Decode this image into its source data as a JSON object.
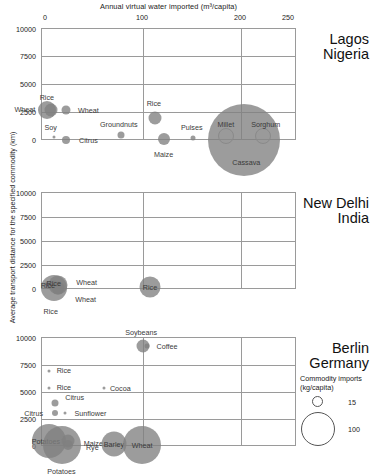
{
  "axes": {
    "x_title": "Annual virtual water imported (m³/capita)",
    "y_title": "Average transport distance for the specified commodity (km)",
    "x_ticks": [
      "0",
      "100",
      "200",
      "250"
    ],
    "y_ticks": [
      "10000",
      "7500",
      "5000",
      "2500",
      "0"
    ]
  },
  "legend": {
    "title_line1": "Commodity imports",
    "title_line2": "(kg/capita)",
    "small_value": "15",
    "large_value": "100"
  },
  "panels": [
    {
      "city": "Lagos",
      "country": "Nigeria"
    },
    {
      "city": "New Delhi",
      "country": "India"
    },
    {
      "city": "Berlin",
      "country": "Germany"
    }
  ],
  "chart_data": {
    "type": "scatter",
    "title": "",
    "xlabel": "Annual virtual water imported (m³/capita)",
    "ylabel": "Average transport distance for the specified commodity (km)",
    "xlim": [
      0,
      260
    ],
    "ylim": [
      -1500,
      10000
    ],
    "grid": true,
    "size_encoding": "Commodity imports (kg/capita)",
    "size_legend": [
      15,
      100
    ],
    "legend_position": "bottom-right",
    "series": [
      {
        "name": "Lagos, Nigeria",
        "points": [
          {
            "label": "Wheat",
            "x": 2,
            "y": 2700,
            "size": 18,
            "label_dx": -22,
            "label_dy": -1
          },
          {
            "label": "Rice",
            "x": 6,
            "y": 2700,
            "size": 13,
            "label_dx": -4,
            "label_dy": -13
          },
          {
            "label": "Wheat",
            "x": 22,
            "y": 2650,
            "size": 9,
            "label_dx": 22,
            "label_dy": 0
          },
          {
            "label": "Soy",
            "x": 9,
            "y": 300,
            "size": 3,
            "label_dx": -3,
            "label_dy": -10
          },
          {
            "label": "Citrus",
            "x": 22,
            "y": 0,
            "size": 8,
            "label_dx": 22,
            "label_dy": 0
          },
          {
            "label": "Groundnuts",
            "x": 78,
            "y": 450,
            "size": 7,
            "label_dx": -2,
            "label_dy": -11
          },
          {
            "label": "Rice",
            "x": 113,
            "y": 2000,
            "size": 13,
            "label_dx": -1,
            "label_dy": -15
          },
          {
            "label": "Maize",
            "x": 122,
            "y": 100,
            "size": 12,
            "label_dx": 0,
            "label_dy": 15
          },
          {
            "label": "Pulses",
            "x": 152,
            "y": 150,
            "size": 5,
            "label_dx": -1,
            "label_dy": -11
          },
          {
            "label": "Cassava",
            "x": 205,
            "y": 0,
            "size": 72,
            "label_dx": 2,
            "label_dy": 22
          },
          {
            "label": "Millet",
            "x": 186,
            "y": 400,
            "size": 14,
            "label_dx": 0,
            "label_dy": -12,
            "ring": true
          },
          {
            "label": "Sorghum",
            "x": 224,
            "y": 400,
            "size": 14,
            "label_dx": 3,
            "label_dy": -12,
            "ring": true
          }
        ]
      },
      {
        "name": "New Delhi, India",
        "points": [
          {
            "label": "Rice",
            "x": 9,
            "y": 150,
            "size": 26,
            "label_dx": -3,
            "label_dy": 23
          },
          {
            "label": "Wheat",
            "x": 13,
            "y": 400,
            "size": 19,
            "label_dx": 29,
            "label_dy": -3
          },
          {
            "label": "Wheat",
            "x": 13,
            "y": 100,
            "size": 13,
            "label_dx": 28,
            "label_dy": 11
          },
          {
            "label": "Rice",
            "x": 4,
            "y": 450,
            "size": 8,
            "label_dx": -1,
            "label_dy": 0
          },
          {
            "label": "Rice",
            "x": 9,
            "y": 600,
            "size": 5,
            "label_dx": 0,
            "label_dy": 0
          },
          {
            "label": "Rice",
            "x": 108,
            "y": 250,
            "size": 21,
            "label_dx": 0,
            "label_dy": 0
          }
        ]
      },
      {
        "name": "Berlin, Germany",
        "points": [
          {
            "label": "Soybeans",
            "x": 101,
            "y": 9200,
            "size": 13,
            "label_dx": -2,
            "label_dy": -14
          },
          {
            "label": "Coffee",
            "x": 105,
            "y": 9150,
            "size": 5,
            "label_dx": 20,
            "label_dy": 0
          },
          {
            "label": "Rice",
            "x": 4,
            "y": 6900,
            "size": 3,
            "label_dx": 15,
            "label_dy": -1
          },
          {
            "label": "Rice",
            "x": 4,
            "y": 5300,
            "size": 3,
            "label_dx": 15,
            "label_dy": -1
          },
          {
            "label": "Cocoa",
            "x": 61,
            "y": 5300,
            "size": 3,
            "label_dx": 16,
            "label_dy": 0
          },
          {
            "label": "Citrus",
            "x": 10,
            "y": 3900,
            "size": 7,
            "label_dx": 20,
            "label_dy": -6
          },
          {
            "label": "Citrus",
            "x": 10,
            "y": 3000,
            "size": 6,
            "label_dx": -21,
            "label_dy": 0
          },
          {
            "label": "Sunflower",
            "x": 21,
            "y": 3050,
            "size": 3,
            "label_dx": 25,
            "label_dy": 0
          },
          {
            "label": "Potatoes",
            "x": 4,
            "y": 500,
            "size": 34,
            "label_dx": -3,
            "label_dy": 0
          },
          {
            "label": "Potatoes",
            "x": 17,
            "y": 100,
            "size": 38,
            "label_dx": 0,
            "label_dy": 26
          },
          {
            "label": "Maize",
            "x": 24,
            "y": 500,
            "size": 13,
            "label_dx": 25,
            "label_dy": 2
          },
          {
            "label": "Rye",
            "x": 24,
            "y": 100,
            "size": 10,
            "label_dx": 24,
            "label_dy": 2
          },
          {
            "label": "Barley",
            "x": 71,
            "y": 200,
            "size": 25,
            "label_dx": 0,
            "label_dy": 0
          },
          {
            "label": "Wheat",
            "x": 100,
            "y": 100,
            "size": 38,
            "label_dx": 0,
            "label_dy": 0
          }
        ]
      }
    ]
  }
}
